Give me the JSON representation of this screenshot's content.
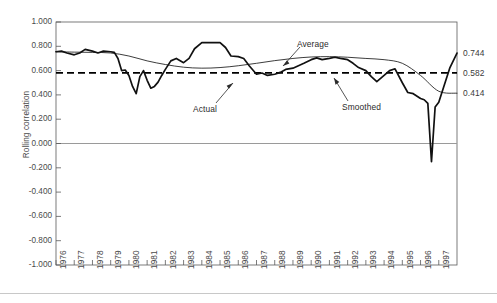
{
  "chart_data": {
    "type": "line",
    "title": "",
    "xlabel": "",
    "ylabel": "Rolling correlation",
    "xlim": [
      1976,
      1998
    ],
    "ylim": [
      -1.0,
      1.0
    ],
    "grid": false,
    "legend": "annotations",
    "ytick_labels": [
      "1.000",
      "0.800",
      "0.600",
      "0.400",
      "0.200",
      "0.000",
      "-0.200",
      "-0.400",
      "-0.600",
      "-0.800",
      "-1.000"
    ],
    "ytick_values": [
      1.0,
      0.8,
      0.6,
      0.4,
      0.2,
      0.0,
      -0.2,
      -0.4,
      -0.6,
      -0.8,
      -1.0
    ],
    "xtick_labels": [
      "1976",
      "1977",
      "1978",
      "1979",
      "1980",
      "1981",
      "1982",
      "1983",
      "1984",
      "1985",
      "1986",
      "1987",
      "1988",
      "1989",
      "1990",
      "1991",
      "1992",
      "1993",
      "1994",
      "1995",
      "1996",
      "1997"
    ],
    "annotations": [
      {
        "name": "Average",
        "target": "average-dashed-line"
      },
      {
        "name": "Actual",
        "target": "actual-series"
      },
      {
        "name": "Smoothed",
        "target": "smoothed-series"
      }
    ],
    "end_labels": [
      {
        "text": "0.744",
        "value": 0.744,
        "series": "Actual"
      },
      {
        "text": "0.582",
        "value": 0.582,
        "series": "Average"
      },
      {
        "text": "0.414",
        "value": 0.414,
        "series": "Smoothed"
      }
    ],
    "zero_line": 0.0,
    "average_level": 0.582,
    "series": [
      {
        "name": "Actual",
        "style": "thick-solid-black",
        "x": [
          1976.0,
          1976.3,
          1976.6,
          1977.0,
          1977.3,
          1977.6,
          1978.0,
          1978.3,
          1978.6,
          1979.0,
          1979.2,
          1979.4,
          1979.6,
          1979.8,
          1980.0,
          1980.2,
          1980.4,
          1980.6,
          1980.8,
          1981.0,
          1981.2,
          1981.4,
          1981.6,
          1981.8,
          1982.0,
          1982.3,
          1982.6,
          1983.0,
          1983.3,
          1983.6,
          1984.0,
          1984.3,
          1984.6,
          1985.0,
          1985.3,
          1985.6,
          1986.0,
          1986.3,
          1986.6,
          1987.0,
          1987.3,
          1987.6,
          1988.0,
          1988.3,
          1988.6,
          1989.0,
          1989.3,
          1989.6,
          1990.0,
          1990.3,
          1990.6,
          1991.0,
          1991.3,
          1991.6,
          1992.0,
          1992.3,
          1992.6,
          1993.0,
          1993.3,
          1993.6,
          1994.0,
          1994.3,
          1994.6,
          1995.0,
          1995.3,
          1995.6,
          1996.0,
          1996.2,
          1996.4,
          1996.6,
          1996.8,
          1997.0,
          1997.3,
          1997.6,
          1998.0
        ],
        "y": [
          0.755,
          0.76,
          0.745,
          0.73,
          0.745,
          0.775,
          0.76,
          0.745,
          0.76,
          0.755,
          0.75,
          0.7,
          0.6,
          0.605,
          0.56,
          0.47,
          0.41,
          0.55,
          0.6,
          0.52,
          0.455,
          0.47,
          0.505,
          0.56,
          0.61,
          0.68,
          0.7,
          0.665,
          0.7,
          0.78,
          0.83,
          0.83,
          0.83,
          0.83,
          0.79,
          0.72,
          0.715,
          0.7,
          0.64,
          0.57,
          0.58,
          0.56,
          0.57,
          0.585,
          0.61,
          0.62,
          0.64,
          0.66,
          0.69,
          0.705,
          0.69,
          0.7,
          0.71,
          0.7,
          0.69,
          0.66,
          0.625,
          0.6,
          0.55,
          0.51,
          0.56,
          0.6,
          0.615,
          0.5,
          0.42,
          0.41,
          0.37,
          0.36,
          0.33,
          -0.15,
          0.3,
          0.34,
          0.48,
          0.62,
          0.744
        ]
      },
      {
        "name": "Smoothed",
        "style": "thin-solid-black",
        "x": [
          1976.0,
          1977.0,
          1978.0,
          1979.0,
          1980.0,
          1981.0,
          1982.0,
          1983.0,
          1984.0,
          1985.0,
          1986.0,
          1987.0,
          1988.0,
          1989.0,
          1990.0,
          1991.0,
          1992.0,
          1993.0,
          1994.0,
          1995.0,
          1996.0,
          1997.0,
          1998.0
        ],
        "y": [
          0.755,
          0.752,
          0.75,
          0.745,
          0.72,
          0.68,
          0.65,
          0.628,
          0.62,
          0.625,
          0.64,
          0.66,
          0.682,
          0.7,
          0.712,
          0.715,
          0.71,
          0.7,
          0.69,
          0.66,
          0.56,
          0.43,
          0.414
        ]
      },
      {
        "name": "Average",
        "style": "dashed-black",
        "level": 0.582
      }
    ]
  },
  "axes": {
    "ylabel": "Rolling correlation"
  }
}
